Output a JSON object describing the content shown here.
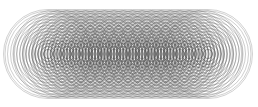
{
  "figure": {
    "title": "Nested circle family forming stadium envelopes",
    "kind": "geometric-line-art",
    "background_color": "#ffffff",
    "stroke_color": "#5a5a5a",
    "stroke_color_dark": "#3a3a3a",
    "stroke_width": 0.45,
    "canvas": {
      "width": 258,
      "height": 107
    }
  },
  "chart_data": {
    "type": "scatter",
    "title": "Nested circle family forming stadium envelopes",
    "subtitle": "",
    "xlabel": "",
    "ylabel": "",
    "xlim": [
      0,
      258
    ],
    "ylim": [
      0,
      107
    ],
    "grid": false,
    "legend": "none",
    "axis_line_y": 54,
    "center_x_start": 48,
    "center_x_end": 208,
    "center_count": 18,
    "radii": [
      4.5,
      7.5,
      10.5,
      13.5,
      16.5,
      19.5,
      22.5,
      25.5,
      28.5,
      31.5,
      34.5,
      37.5,
      40.5,
      43.0,
      44.5
    ],
    "radius_count": 15,
    "centers_x": [
      48,
      57.4,
      66.8,
      76.2,
      85.6,
      95.1,
      104.5,
      113.9,
      123.3,
      132.7,
      142.1,
      151.5,
      160.9,
      170.4,
      179.8,
      189.2,
      198.6,
      208
    ]
  },
  "labels": {
    "top_band": "",
    "bottom_band": "",
    "inner_band": ""
  }
}
